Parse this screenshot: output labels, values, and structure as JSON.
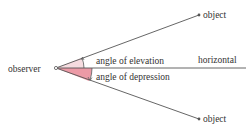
{
  "diagram": {
    "labels": {
      "observer": "observer",
      "object_top": "object",
      "object_bottom": "object",
      "horizontal": "horizontal",
      "elevation": "angle of elevation",
      "depression": "angle of depression"
    },
    "colors": {
      "line": "#555555",
      "elevation_fill": "#f6dce0",
      "depression_fill": "#ec9aa6",
      "text": "#333333"
    }
  }
}
